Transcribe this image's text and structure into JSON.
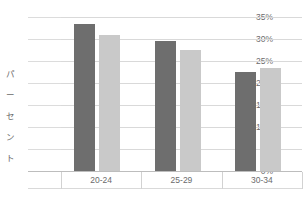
{
  "chart_data": {
    "type": "bar",
    "title": "",
    "subtitle": "",
    "xlabel": "",
    "ylabel": "パーセント",
    "categories": [
      "20-24",
      "25-29",
      "30-34"
    ],
    "series": [
      {
        "name": "series-1",
        "color": "#6e6e6e",
        "values": [
          33.5,
          29.5,
          22.5
        ]
      },
      {
        "name": "series-2",
        "color": "#c9c9c9",
        "values": [
          31.0,
          27.5,
          23.5
        ]
      }
    ],
    "ylim": [
      0,
      35
    ],
    "ytick_values": [
      0,
      5,
      10,
      15,
      20,
      25,
      30,
      35
    ],
    "ytick_labels": [
      "0%",
      "5%",
      "10%",
      "15%",
      "20%",
      "25%",
      "30%",
      "35%"
    ],
    "grid": true,
    "legend": "none",
    "annotations": []
  },
  "axis": {
    "y_title_chars": [
      "パ",
      "ー",
      "セ",
      "ン",
      "ト"
    ]
  },
  "colors": {
    "background": "#ffffff",
    "gridline": "#d9d9d9",
    "axis_line": "#bdbdbd",
    "text": "#6b6b6b",
    "series_dark": "#6e6e6e",
    "series_light": "#c9c9c9"
  }
}
